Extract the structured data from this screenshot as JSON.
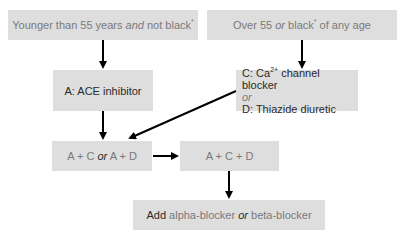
{
  "colors": {
    "background": "#ffffff",
    "box_fill": "#dedede",
    "muted_text": "#7a7a7a",
    "dark_text": "#2a2a2a",
    "arrow": "#000000"
  },
  "nodes": {
    "young": {
      "text_a": "Younger than 55 years ",
      "text_em": "and",
      "text_b": " not black",
      "marker": "*"
    },
    "old": {
      "text_a": "Over 55 ",
      "text_em": "or",
      "text_b": " black",
      "marker": "*",
      "text_c": " of any age"
    },
    "ace": {
      "letter": "A",
      "sep": ": ",
      "label": "ACE inhibitor"
    },
    "cd": {
      "c_letter": "C",
      "c_sep": ": Ca",
      "c_sup": "2+",
      "c_label": " channel blocker",
      "or": "or",
      "d_letter": "D",
      "d_sep": ": ",
      "d_label": "Thiazide diuretic"
    },
    "ac_or_ad": {
      "a": "A + C ",
      "or": "or",
      "b": " A + D"
    },
    "acd": {
      "label": "A + C + D"
    },
    "add": {
      "verb": "Add",
      "a": " alpha-blocker ",
      "or": "or",
      "b": " beta-blocker"
    }
  },
  "edges": [
    {
      "from": "young",
      "to": "ace"
    },
    {
      "from": "old",
      "to": "cd"
    },
    {
      "from": "ace",
      "to": "ac_or_ad"
    },
    {
      "from": "cd",
      "to": "ac_or_ad"
    },
    {
      "from": "ac_or_ad",
      "to": "acd"
    },
    {
      "from": "acd",
      "to": "add"
    }
  ]
}
